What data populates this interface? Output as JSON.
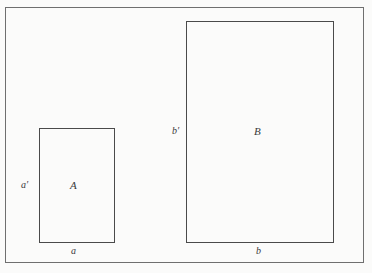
{
  "figure": {
    "background_color": "#fbfbfa",
    "frame_color": "#6f6f6f",
    "rect_color": "#4a4a4a",
    "text_color": "#3a3a3a"
  },
  "rectangles": {
    "small": {
      "name_label": "A",
      "width_label": "a",
      "height_label": "a′"
    },
    "large": {
      "name_label": "B",
      "width_label": "b",
      "height_label": "b′"
    }
  }
}
